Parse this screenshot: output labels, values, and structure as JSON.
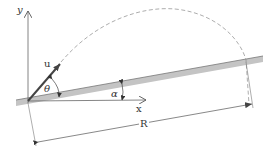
{
  "diagram": {
    "labels": {
      "y_axis": "y",
      "x_axis": "x",
      "velocity": "u",
      "launch_angle": "θ",
      "incline_angle": "α",
      "range": "R"
    },
    "colors": {
      "line": "#555555",
      "incline_fill": "#bdbdbd",
      "incline_edge": "#6e6e6e",
      "trajectory": "#8a8a8a",
      "background": "#ffffff"
    }
  }
}
